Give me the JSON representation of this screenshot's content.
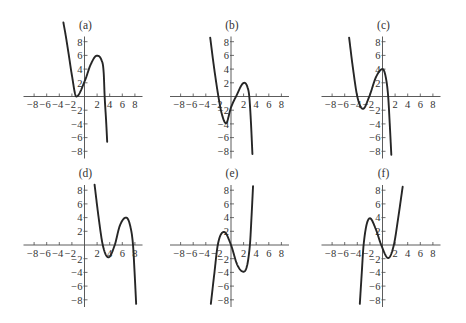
{
  "chart_data": [
    {
      "type": "line",
      "title": "(a)",
      "xlabel": "",
      "ylabel": "",
      "xlim": [
        -8,
        8
      ],
      "ylim": [
        -8,
        8
      ],
      "grid": false,
      "x_ticks": [
        -8,
        -6,
        -4,
        -2,
        2,
        4,
        6,
        8
      ],
      "x_tick_labels": [
        "−8",
        "−6",
        "−4",
        "−2",
        "2",
        "4",
        "6",
        "8"
      ],
      "y_ticks": [
        8,
        6,
        4,
        2,
        -2,
        -4,
        -6,
        -8
      ],
      "y_tick_labels": [
        "8",
        "6",
        "4",
        "2",
        "−2",
        "−4",
        "−6",
        "−8"
      ],
      "series": [
        {
          "name": "f(a)",
          "points": [
            [
              -3.35,
              10.8
            ],
            [
              -3.0,
              9.0
            ],
            [
              -2.5,
              6.1
            ],
            [
              -2.0,
              3.1
            ],
            [
              -1.3,
              0
            ],
            [
              0.1,
              2.4
            ],
            [
              0.95,
              4.6
            ],
            [
              1.95,
              5.95
            ],
            [
              2.7,
              5.3
            ],
            [
              3.05,
              3.4
            ],
            [
              3.2,
              0
            ],
            [
              3.44,
              -3.7
            ],
            [
              3.6,
              -6.6
            ]
          ],
          "local_min": [
            -1.3,
            0
          ],
          "local_max": [
            1.95,
            5.95
          ]
        }
      ]
    },
    {
      "type": "line",
      "title": "(b)",
      "xlabel": "",
      "ylabel": "",
      "xlim": [
        -8,
        8
      ],
      "ylim": [
        -8,
        8
      ],
      "grid": false,
      "x_ticks": [
        -8,
        -6,
        -4,
        -2,
        2,
        4,
        6,
        8
      ],
      "x_tick_labels": [
        "−8",
        "−6",
        "−4",
        "−2",
        "2",
        "4",
        "6",
        "8"
      ],
      "y_ticks": [
        8,
        6,
        4,
        2,
        -2,
        -4,
        -6,
        -8
      ],
      "y_tick_labels": [
        "8",
        "6",
        "4",
        "2",
        "−2",
        "−4",
        "−6",
        "−8"
      ],
      "series": [
        {
          "name": "f(b)",
          "points": [
            [
              -3.3,
              8.6
            ],
            [
              -2.7,
              4.3
            ],
            [
              -2.0,
              0
            ],
            [
              -1.5,
              -2.4
            ],
            [
              -0.8,
              -3.9
            ],
            [
              0,
              -1.6
            ],
            [
              0.8,
              0
            ],
            [
              2.1,
              2.0
            ],
            [
              2.6,
              1.4
            ],
            [
              2.9,
              0
            ],
            [
              3.15,
              -3.5
            ],
            [
              3.4,
              -8.4
            ]
          ],
          "local_min": [
            -0.8,
            -3.9
          ],
          "local_max": [
            2.1,
            2.0
          ]
        }
      ]
    },
    {
      "type": "line",
      "title": "(c)",
      "xlabel": "",
      "ylabel": "",
      "xlim": [
        -8,
        8
      ],
      "ylim": [
        -8,
        8
      ],
      "grid": false,
      "x_ticks": [
        -8,
        -6,
        -4,
        -2,
        2,
        4,
        6,
        8
      ],
      "x_tick_labels": [
        "−8",
        "−6",
        "−4",
        "−2",
        "2",
        "4",
        "6",
        "8"
      ],
      "y_ticks": [
        8,
        6,
        4,
        2,
        -2,
        -4,
        -6,
        -8
      ],
      "y_tick_labels": [
        "8",
        "6",
        "4",
        "2",
        "−2",
        "−4",
        "−6",
        "−8"
      ],
      "series": [
        {
          "name": "f(c)",
          "points": [
            [
              -5.3,
              8.6
            ],
            [
              -4.7,
              4.2
            ],
            [
              -4.0,
              0
            ],
            [
              -3.1,
              -1.8
            ],
            [
              -2.1,
              0
            ],
            [
              -1.0,
              2.9
            ],
            [
              0,
              4.0
            ],
            [
              0.5,
              2.9
            ],
            [
              0.9,
              0
            ],
            [
              1.15,
              -4.0
            ],
            [
              1.4,
              -8.5
            ]
          ],
          "local_min": [
            -3.1,
            -1.8
          ],
          "local_max": [
            0,
            4.0
          ]
        }
      ]
    },
    {
      "type": "line",
      "title": "(d)",
      "xlabel": "",
      "ylabel": "",
      "xlim": [
        -8,
        8
      ],
      "ylim": [
        -8,
        8
      ],
      "grid": false,
      "x_ticks": [
        -8,
        -6,
        -4,
        -2,
        2,
        4,
        6,
        8
      ],
      "x_tick_labels": [
        "−8",
        "−6",
        "−4",
        "−2",
        "2",
        "4",
        "6",
        "8"
      ],
      "y_ticks": [
        8,
        6,
        4,
        2,
        -2,
        -4,
        -6,
        -8
      ],
      "y_tick_labels": [
        "8",
        "6",
        "4",
        "2",
        "−2",
        "−4",
        "−6",
        "−8"
      ],
      "series": [
        {
          "name": "f(d)",
          "points": [
            [
              1.6,
              8.8
            ],
            [
              2.2,
              4.3
            ],
            [
              2.9,
              0
            ],
            [
              3.8,
              -1.8
            ],
            [
              4.8,
              0
            ],
            [
              5.6,
              2.8
            ],
            [
              6.6,
              4.0
            ],
            [
              7.25,
              2.8
            ],
            [
              7.7,
              0
            ],
            [
              7.95,
              -4.0
            ],
            [
              8.2,
              -8.6
            ]
          ],
          "local_min": [
            3.8,
            -1.8
          ],
          "local_max": [
            6.6,
            4.0
          ]
        }
      ]
    },
    {
      "type": "line",
      "title": "(e)",
      "xlabel": "",
      "ylabel": "",
      "xlim": [
        -8,
        8
      ],
      "ylim": [
        -8,
        8
      ],
      "grid": false,
      "x_ticks": [
        -8,
        -6,
        -4,
        -2,
        2,
        4,
        6,
        8
      ],
      "x_tick_labels": [
        "−8",
        "−6",
        "−4",
        "−2",
        "2",
        "4",
        "6",
        "8"
      ],
      "y_ticks": [
        8,
        6,
        4,
        2,
        -2,
        -4,
        -6,
        -8
      ],
      "y_tick_labels": [
        "8",
        "6",
        "4",
        "2",
        "−2",
        "−4",
        "−6",
        "−8"
      ],
      "series": [
        {
          "name": "f(e)",
          "points": [
            [
              -3.2,
              -8.6
            ],
            [
              -2.65,
              -4.2
            ],
            [
              -2.1,
              0
            ],
            [
              -1.1,
              1.9
            ],
            [
              0,
              0
            ],
            [
              1.0,
              -2.9
            ],
            [
              2.0,
              -3.9
            ],
            [
              3.0,
              0
            ],
            [
              3.25,
              4.0
            ],
            [
              3.5,
              8.6
            ]
          ],
          "local_min": [
            2.0,
            -3.9
          ],
          "local_max": [
            -1.1,
            1.9
          ]
        }
      ]
    },
    {
      "type": "line",
      "title": "(f)",
      "xlabel": "",
      "ylabel": "",
      "xlim": [
        -8,
        8
      ],
      "ylim": [
        -8,
        8
      ],
      "grid": false,
      "x_ticks": [
        -8,
        -6,
        -4,
        -2,
        2,
        4,
        6,
        8
      ],
      "x_tick_labels": [
        "−8",
        "−6",
        "−4",
        "−2",
        "2",
        "4",
        "6",
        "8"
      ],
      "y_ticks": [
        8,
        6,
        4,
        2,
        -2,
        -4,
        -6,
        -8
      ],
      "y_tick_labels": [
        "8",
        "6",
        "4",
        "2",
        "−2",
        "−4",
        "−6",
        "−8"
      ],
      "series": [
        {
          "name": "f(f)",
          "points": [
            [
              -3.6,
              -8.6
            ],
            [
              -3.3,
              -4.2
            ],
            [
              -3.0,
              0
            ],
            [
              -2.0,
              3.9
            ],
            [
              -1.1,
              2.4
            ],
            [
              -0.2,
              0
            ],
            [
              0.9,
              -1.9
            ],
            [
              1.8,
              0
            ],
            [
              2.5,
              4.0
            ],
            [
              3.2,
              8.5
            ]
          ],
          "local_min": [
            0.9,
            -1.9
          ],
          "local_max": [
            -2.0,
            3.9
          ]
        }
      ]
    }
  ]
}
